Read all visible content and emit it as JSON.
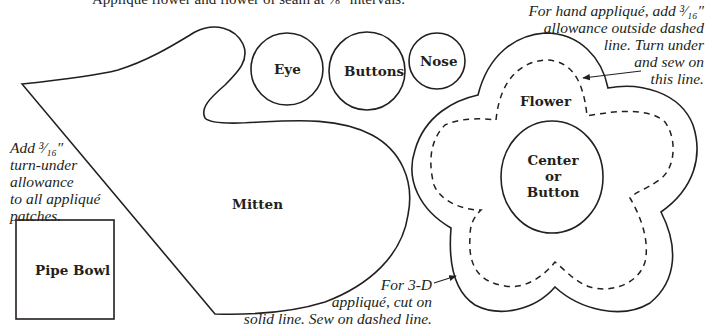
{
  "header": {
    "cropped_line_left": "Appliqué flower and flower",
    "cropped_line_right": "of seam at ⅛\" intervals."
  },
  "pattern_pieces": [
    {
      "id": "mitten",
      "label": "Mitten"
    },
    {
      "id": "eye",
      "label": "Eye"
    },
    {
      "id": "buttons",
      "label": "Buttons"
    },
    {
      "id": "nose",
      "label": "Nose"
    },
    {
      "id": "flower",
      "label": "Flower"
    },
    {
      "id": "center",
      "label_lines": [
        "Center",
        "or",
        "Button"
      ]
    },
    {
      "id": "pipe-bowl",
      "label": "Pipe Bowl"
    }
  ],
  "labels": {
    "mitten": "Mitten",
    "eye": "Eye",
    "buttons": "Buttons",
    "nose": "Nose",
    "flower": "Flower",
    "center_1": "Center",
    "center_2": "or",
    "center_3": "Button",
    "pipe_bowl": "Pipe Bowl"
  },
  "notes": {
    "allowance": [
      "Add ³⁄₁₆″",
      "turn-under",
      "allowance",
      "to all appliqué",
      "patches."
    ],
    "hand_applique": [
      "For hand appliqué, add ³⁄₁₆″",
      "allowance outside dashed",
      "line. Turn under",
      "and sew on",
      "this line."
    ],
    "three_d": [
      "For 3-D",
      "appliqué, cut on",
      "solid line. Sew on dashed line."
    ]
  },
  "colors": {
    "ink": "#231f20",
    "background": "#ffffff"
  }
}
